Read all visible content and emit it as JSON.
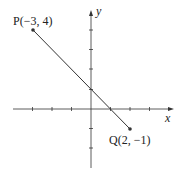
{
  "diagram": {
    "type": "coordinate-plane-segment",
    "axes": {
      "x_label": "x",
      "y_label": "y",
      "x_ticks": [
        -3,
        -2,
        -1,
        1,
        2,
        3
      ],
      "y_ticks": [
        -3,
        -2,
        -1,
        1,
        2,
        3,
        4
      ]
    },
    "points": [
      {
        "name": "P",
        "label": "P(−3, 4)",
        "x": -3,
        "y": 4
      },
      {
        "name": "Q",
        "label": "Q(2, −1)",
        "x": 2,
        "y": -1
      }
    ],
    "segment": {
      "from": "P",
      "to": "Q"
    },
    "colors": {
      "line": "#333333",
      "axis": "#333333"
    }
  }
}
